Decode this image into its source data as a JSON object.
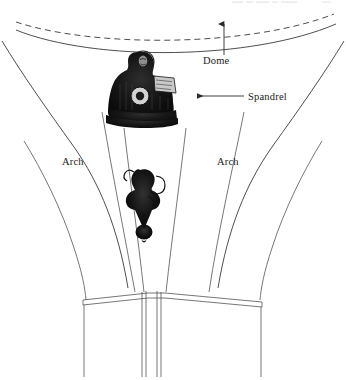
{
  "figure": {
    "type": "architectural-line-diagram",
    "background_color": "#ffffff",
    "line_color": "#3a3a3a",
    "width": 346,
    "height": 380
  },
  "top_caption": {
    "text": "",
    "note": "faint clipped text strip along the very top edge, illegible",
    "color": "#c8c8cc"
  },
  "labels": [
    {
      "id": "dome",
      "text": "Dome",
      "x": 203,
      "y": 64,
      "anchor": "start",
      "leader": "vertical-arrow-up",
      "arrow_direction": "up"
    },
    {
      "id": "spandrel",
      "text": "Spandrel",
      "x": 248,
      "y": 100,
      "anchor": "start",
      "leader": "horizontal-arrow-left",
      "arrow_direction": "left"
    },
    {
      "id": "arch-left",
      "text": "Arch",
      "x": 62,
      "y": 165,
      "anchor": "start",
      "leader": "none",
      "arrow_direction": "none"
    },
    {
      "id": "arch-right",
      "text": "Arch",
      "x": 217,
      "y": 165,
      "anchor": "start",
      "leader": "none",
      "arrow_direction": "none"
    }
  ],
  "elements": {
    "dome_arc_dashed": "upper dome springing line, dashed",
    "dome_arc_solid": "lower dome base line, solid",
    "arch_left": "left arch intrados curve",
    "arch_right": "right arch intrados curve",
    "pendentive_v": "central pendentive converging to pier",
    "evangelist_figure": "engraved seated figure with halo holding a book",
    "pendant_ornament": "hanging carved pendant / boss below the figure",
    "impost_molding": "horizontal capital / impost molding",
    "pier": "central vertical pier shaft",
    "pier_left": "left vertical pier shaft",
    "pier_right": "right vertical pier shaft"
  },
  "icon_names": {
    "arrow_up": "arrow-up-icon",
    "arrow_left": "arrow-left-icon",
    "halo": "halo-circle-icon"
  }
}
